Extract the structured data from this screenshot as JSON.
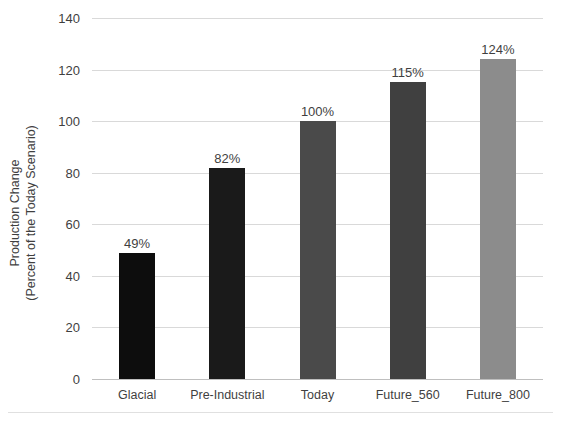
{
  "chart_data": {
    "type": "bar",
    "title": "",
    "xlabel": "",
    "ylabel": "Production Change (Percent of the Today Scenario)",
    "ylabel_lines": [
      "Production Change",
      "(Percent of the Today Scenario)"
    ],
    "categories": [
      "Glacial",
      "Pre-Industrial",
      "Today",
      "Future_560",
      "Future_800"
    ],
    "values": [
      49,
      82,
      100,
      115,
      124
    ],
    "data_labels": [
      "49%",
      "82%",
      "100%",
      "115%",
      "124%"
    ],
    "bar_colors": [
      "#0d0d0d",
      "#1a1a1a",
      "#4a4a4a",
      "#404040",
      "#8c8c8c"
    ],
    "ylim": [
      0,
      140
    ],
    "ytick_values": [
      0,
      20,
      40,
      60,
      80,
      100,
      120,
      140
    ],
    "ytick_labels": [
      "0",
      "20",
      "40",
      "60",
      "80",
      "100",
      "120",
      "140"
    ],
    "grid": true,
    "grid_color": "#d9d9d9",
    "legend": "none",
    "background": "#ffffff",
    "text_color": "#3f3f3f"
  }
}
